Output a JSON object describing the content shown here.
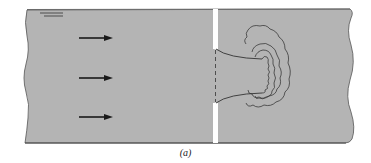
{
  "figure": {
    "caption": "(a)",
    "colors": {
      "fluid": "#b4b4b4",
      "outline": "#4a4a4a",
      "wall": "#ffffff",
      "arrow": "#1a1a1a",
      "line": "#333333"
    },
    "elements": {
      "free_surface_symbol": "free-surface-indicator",
      "flow_arrows": [
        {
          "id": "arrow-1",
          "direction": "right"
        },
        {
          "id": "arrow-2",
          "direction": "right"
        },
        {
          "id": "arrow-3",
          "direction": "right"
        }
      ],
      "wall": "orifice-plate",
      "jet": "contracting-jet",
      "eddies": "turbulent-eddy-contours"
    }
  }
}
